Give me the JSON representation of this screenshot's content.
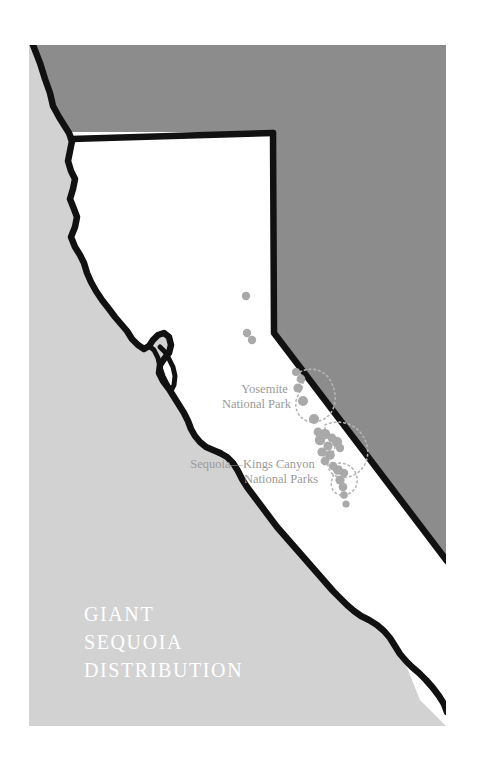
{
  "figure": {
    "title_lines": [
      "GIANT",
      "SEQUOIA",
      "DISTRIBUTION"
    ],
    "kind": "thematic distribution map"
  },
  "colors": {
    "ocean_gray": "#d2d2d2",
    "nevada_gray": "#8c8c8c",
    "state_fill": "#ffffff",
    "outline_black": "#111111",
    "grove_dot": "#a9a9a9",
    "park_boundary": "#b5b5b5",
    "label_gray": "#9a9a9a",
    "title_white": "#ffffff",
    "page_white": "#ffffff"
  },
  "labels": [
    {
      "name": "yosemite",
      "lines": [
        "Yosemite",
        "National Park"
      ],
      "x": 291,
      "y": 393
    },
    {
      "name": "sequoia-kings-canyon",
      "lines": [
        "Sequoia—Kings Canyon",
        "National Parks"
      ],
      "x": 318,
      "y": 468
    }
  ],
  "chart_data": {
    "type": "scatter",
    "title": "GIANT SEQUOIA DISTRIBUTION",
    "xlabel": "",
    "ylabel": "",
    "legend": [],
    "grid": false,
    "series": [
      {
        "name": "Giant sequoia groves",
        "marker": "filled-circle",
        "color": "#a9a9a9",
        "points": [
          {
            "x": 246,
            "y": 296,
            "r": 4.2
          },
          {
            "x": 247,
            "y": 333,
            "r": 4.2
          },
          {
            "x": 252,
            "y": 340,
            "r": 4.2
          },
          {
            "x": 296,
            "y": 372,
            "r": 4.0
          },
          {
            "x": 301,
            "y": 379,
            "r": 4.4
          },
          {
            "x": 298,
            "y": 388,
            "r": 4.6
          },
          {
            "x": 303,
            "y": 401,
            "r": 5.0
          },
          {
            "x": 314,
            "y": 419,
            "r": 5.0
          },
          {
            "x": 318,
            "y": 432,
            "r": 4.4
          },
          {
            "x": 325,
            "y": 434,
            "r": 5.2
          },
          {
            "x": 320,
            "y": 440,
            "r": 5.2
          },
          {
            "x": 332,
            "y": 438,
            "r": 4.4
          },
          {
            "x": 337,
            "y": 442,
            "r": 5.2
          },
          {
            "x": 328,
            "y": 446,
            "r": 4.6
          },
          {
            "x": 340,
            "y": 448,
            "r": 4.2
          },
          {
            "x": 322,
            "y": 452,
            "r": 4.6
          },
          {
            "x": 330,
            "y": 455,
            "r": 4.8
          },
          {
            "x": 325,
            "y": 461,
            "r": 4.4
          },
          {
            "x": 333,
            "y": 466,
            "r": 4.2
          },
          {
            "x": 338,
            "y": 470,
            "r": 4.8
          },
          {
            "x": 344,
            "y": 473,
            "r": 4.2
          },
          {
            "x": 340,
            "y": 480,
            "r": 4.6
          },
          {
            "x": 343,
            "y": 487,
            "r": 4.4
          },
          {
            "x": 344,
            "y": 495,
            "r": 3.8
          },
          {
            "x": 346,
            "y": 504,
            "r": 3.6
          }
        ]
      }
    ],
    "annotations": [
      {
        "text": "Yosemite National Park",
        "x": 291,
        "y": 393
      },
      {
        "text": "Sequoia—Kings Canyon National Parks",
        "x": 318,
        "y": 468
      }
    ]
  }
}
